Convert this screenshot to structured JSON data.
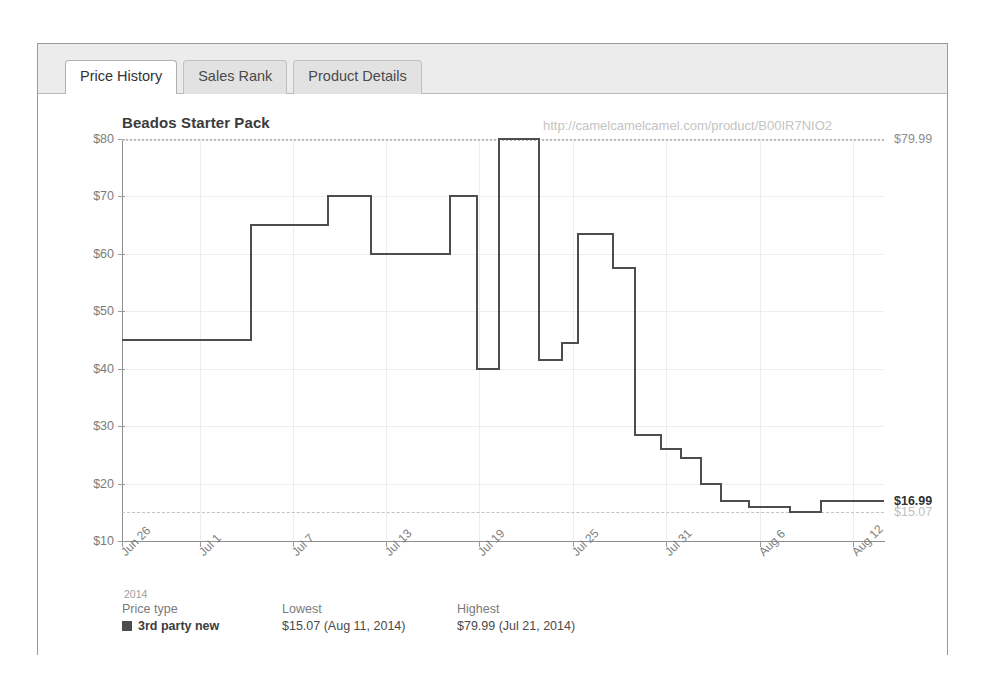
{
  "tabs": [
    {
      "label": "Price History",
      "active": true
    },
    {
      "label": "Sales Rank",
      "active": false
    },
    {
      "label": "Product Details",
      "active": false
    }
  ],
  "chart_title": "Beados Starter Pack",
  "watermark": "http://camelcamelcamel.com/product/B00IR7NIO2",
  "edge_labels": {
    "max": "$79.99",
    "current": "$16.99",
    "min": "$15.07"
  },
  "legend": {
    "year": "2014",
    "headers": [
      "Price type",
      "Lowest",
      "Highest"
    ],
    "rows": [
      {
        "type": "3rd party new",
        "lowest": "$15.07 (Aug 11, 2014)",
        "highest": "$79.99 (Jul 21, 2014)",
        "color": "#4d4d4d"
      }
    ]
  },
  "chart_data": {
    "type": "line",
    "subtype": "step-post",
    "title": "Beados Starter Pack",
    "xlabel": "",
    "ylabel": "",
    "ylim": [
      10,
      80
    ],
    "yticks": [
      10,
      20,
      30,
      40,
      50,
      60,
      70,
      80
    ],
    "ytick_labels": [
      "$10",
      "$20",
      "$30",
      "$40",
      "$50",
      "$60",
      "$70",
      "$80"
    ],
    "xlim": [
      "Jun 26",
      "Aug 15"
    ],
    "xticks": [
      "Jun 26",
      "Jul 1",
      "Jul 7",
      "Jul 13",
      "Jul 19",
      "Jul 25",
      "Jul 31",
      "Aug 6",
      "Aug 12"
    ],
    "xtick_positions": [
      0,
      0.102,
      0.224,
      0.347,
      0.469,
      0.592,
      0.714,
      0.837,
      0.959
    ],
    "grid": true,
    "legend_position": "below",
    "series": [
      {
        "name": "3rd party new",
        "color": "#4d4d4d",
        "x": [
          0.0,
          0.169,
          0.27,
          0.327,
          0.43,
          0.466,
          0.495,
          0.531,
          0.547,
          0.56,
          0.578,
          0.598,
          0.614,
          0.645,
          0.673,
          0.707,
          0.733,
          0.76,
          0.786,
          0.823,
          0.876,
          0.917,
          0.955,
          1.0
        ],
        "y": [
          45.0,
          65.0,
          70.0,
          60.0,
          70.0,
          39.99,
          79.99,
          79.99,
          41.5,
          41.5,
          44.5,
          63.5,
          63.5,
          57.5,
          28.5,
          26.0,
          24.5,
          20.0,
          17.0,
          16.0,
          15.07,
          16.99,
          16.99,
          16.99
        ],
        "points": [
          {
            "x": 0.0,
            "price": 45.0
          },
          {
            "x": 0.169,
            "price": 65.0
          },
          {
            "x": 0.27,
            "price": 70.0
          },
          {
            "x": 0.327,
            "price": 60.0
          },
          {
            "x": 0.43,
            "price": 70.0
          },
          {
            "x": 0.466,
            "price": 39.99
          },
          {
            "x": 0.495,
            "price": 79.99
          },
          {
            "x": 0.547,
            "price": 41.5
          },
          {
            "x": 0.578,
            "price": 44.5
          },
          {
            "x": 0.598,
            "price": 63.5
          },
          {
            "x": 0.645,
            "price": 57.5
          },
          {
            "x": 0.673,
            "price": 28.5
          },
          {
            "x": 0.707,
            "price": 26.0
          },
          {
            "x": 0.733,
            "price": 24.5
          },
          {
            "x": 0.76,
            "price": 20.0
          },
          {
            "x": 0.786,
            "price": 17.0
          },
          {
            "x": 0.823,
            "price": 16.0
          },
          {
            "x": 0.876,
            "price": 15.07
          },
          {
            "x": 0.917,
            "price": 16.99
          }
        ]
      }
    ],
    "reference_lines": [
      {
        "name": "highest",
        "value": 79.99,
        "style": "dotted",
        "color": "#bdbdbd"
      },
      {
        "name": "lowest",
        "value": 15.07,
        "style": "dashed",
        "color": "#c3c3c3"
      }
    ]
  }
}
